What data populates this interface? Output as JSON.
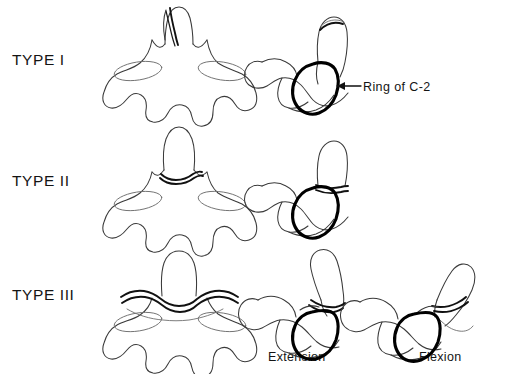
{
  "figure": {
    "background_color": "#ffffff",
    "line_color": "#3a3a3a",
    "emphasis_color": "#000000"
  },
  "rows": [
    {
      "id": "type-1",
      "label": "TYPE I",
      "description": "Oblique avulsion fracture through the tip of the odontoid process",
      "views": [
        "anterior",
        "lateral"
      ]
    },
    {
      "id": "type-2",
      "label": "TYPE II",
      "description": "Transverse fracture through the base of the odontoid process",
      "views": [
        "anterior",
        "lateral"
      ]
    },
    {
      "id": "type-3",
      "label": "TYPE III",
      "description": "Fracture extending into the body of C-2",
      "views": [
        "anterior",
        "lateral-extension",
        "lateral-flexion"
      ]
    }
  ],
  "annotations": {
    "ring_of_c2": {
      "text": "Ring of C-2",
      "points_to": "thickened ring outline on the lateral view of C-2"
    }
  },
  "captions": {
    "extension": "Extension",
    "flexion": "Flexion"
  }
}
